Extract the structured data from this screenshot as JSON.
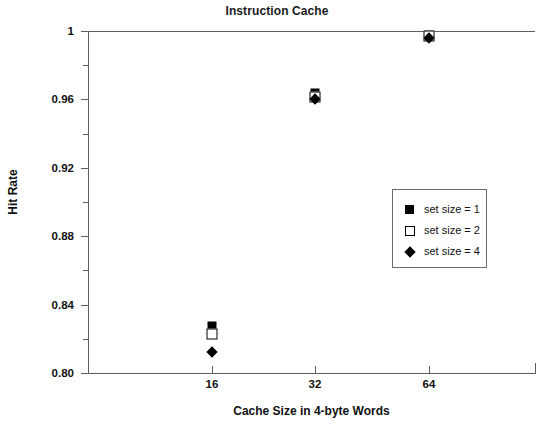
{
  "chart_data": {
    "type": "scatter",
    "title": "Instruction Cache",
    "xlabel": "Cache Size in 4-byte Words",
    "ylabel": "Hit Rate",
    "x": [
      16,
      32,
      64
    ],
    "x_tick_labels": [
      "16",
      "32",
      "64"
    ],
    "y_tick_labels": [
      "1",
      "0.96",
      "0.92",
      "0.88",
      "0.84",
      "0.80"
    ],
    "y_tick_values": [
      1,
      0.96,
      0.92,
      0.88,
      0.84,
      0.8
    ],
    "y_minor_tick_values": [
      0.98,
      0.94,
      0.9,
      0.86,
      0.82
    ],
    "ylim": [
      0.8,
      1.0
    ],
    "xlim_categories": [
      "16",
      "32",
      "64"
    ],
    "grid": false,
    "legend_position": "center-right",
    "series": [
      {
        "name": "set size = 1",
        "marker": "filled-square",
        "color": "#000000",
        "values": [
          0.8275,
          0.9635,
          0.9975
        ]
      },
      {
        "name": "set size = 2",
        "marker": "open-square",
        "color": "#000000",
        "values": [
          0.823,
          0.9615,
          0.997
        ]
      },
      {
        "name": "set size = 4",
        "marker": "filled-diamond",
        "color": "#000000",
        "values": [
          0.812,
          0.96,
          0.996
        ]
      }
    ]
  },
  "axes": {
    "y_ticks": [
      {
        "label": "1",
        "value": 1.0
      },
      {
        "label": "0.96",
        "value": 0.96
      },
      {
        "label": "0.92",
        "value": 0.92
      },
      {
        "label": "0.88",
        "value": 0.88
      },
      {
        "label": "0.84",
        "value": 0.84
      },
      {
        "label": "0.80",
        "value": 0.8
      }
    ],
    "x_ticks": [
      {
        "label": "16",
        "index": 0
      },
      {
        "label": "32",
        "index": 1
      },
      {
        "label": "64",
        "index": 2
      }
    ]
  },
  "legend": {
    "items": [
      {
        "label": "set size = 1",
        "marker": "filled-square"
      },
      {
        "label": "set size = 2",
        "marker": "open-square"
      },
      {
        "label": "set size = 4",
        "marker": "filled-diamond"
      }
    ]
  },
  "colors": {
    "marker": "#000000",
    "axis": "#5e5e5e",
    "legend_border": "#6a6a6a",
    "text": "#111111",
    "background": "#ffffff"
  }
}
